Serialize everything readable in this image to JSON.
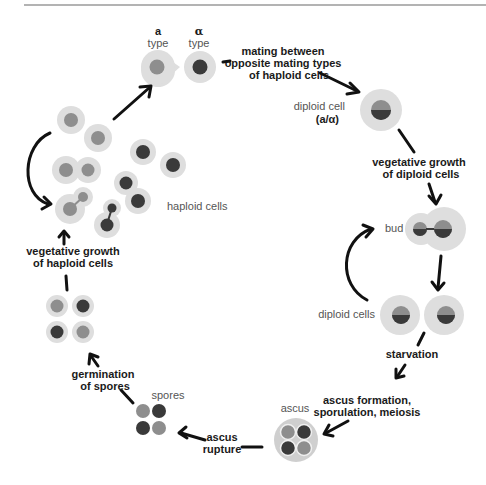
{
  "colors": {
    "cytoplasm": "#dedede",
    "cytoplasm_edge": "#e8e8e8",
    "nucleus_a": "#8e8e8e",
    "nucleus_alpha": "#3a3a3a",
    "arrow": "#111111",
    "rule": "#9a9a9a"
  },
  "labels": {
    "a_symbol": "a",
    "a_type": "type",
    "alpha_symbol": "α",
    "alpha_type": "type",
    "mating_line1": "mating between",
    "mating_line2": "opposite mating types",
    "mating_line3": "of haploid cells",
    "diploid_cell_line1": "diploid cell",
    "diploid_cell_line2": "(a/α)",
    "veg_diploid_line1": "vegetative growth",
    "veg_diploid_line2": "of diploid cells",
    "bud": "bud",
    "diploid_cells": "diploid cells",
    "starvation": "starvation",
    "ascus_formation_line1": "ascus formation,",
    "ascus_formation_line2": "sporulation, meiosis",
    "ascus": "ascus",
    "ascus_rupture_line1": "ascus",
    "ascus_rupture_line2": "rupture",
    "spores": "spores",
    "germination_line1": "germination",
    "germination_line2": "of spores",
    "veg_haploid_line1": "vegetative growth",
    "veg_haploid_line2": "of haploid cells",
    "haploid_cells": "haploid cells"
  }
}
